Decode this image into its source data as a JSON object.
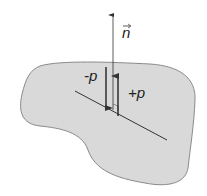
{
  "diagram": {
    "labels": {
      "normal": "n",
      "minus_p": "-p",
      "plus_p": "+p"
    },
    "colors": {
      "body_fill": "#d9d9d9",
      "body_stroke": "#8a8a8a",
      "line": "#333333",
      "background": "#ffffff"
    },
    "elements": [
      {
        "name": "body",
        "type": "blob",
        "description": "irregular gray region"
      },
      {
        "name": "cut-plane",
        "type": "line",
        "description": "section line through body"
      },
      {
        "name": "normal-vector",
        "type": "arrow",
        "label": "n",
        "direction": "up"
      },
      {
        "name": "minus-p-arrow",
        "type": "arrow",
        "label": "-p",
        "direction": "down"
      },
      {
        "name": "plus-p-arrow",
        "type": "arrow",
        "label": "+p",
        "direction": "up"
      }
    ]
  }
}
